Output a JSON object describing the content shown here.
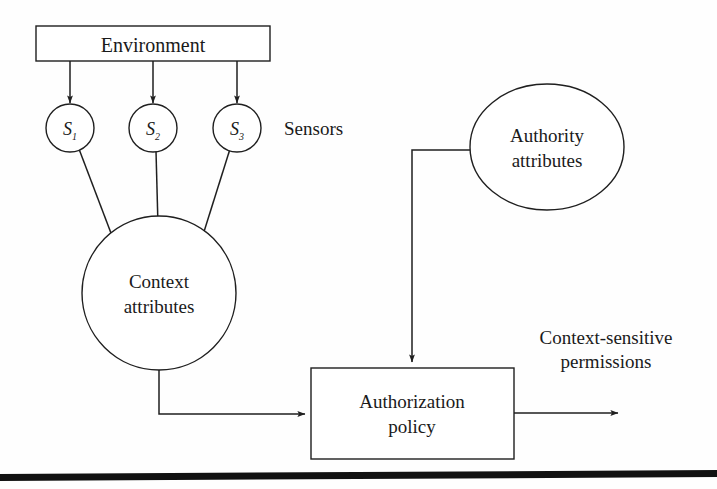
{
  "figure": {
    "background_color": "#fefefe",
    "stroke_color": "#1f1f1f",
    "text_color": "#1a1a1a"
  },
  "nodes": {
    "environment": {
      "label": "Environment",
      "shape": "rectangle"
    },
    "sensor_1": {
      "base": "S",
      "subscript": "1",
      "shape": "circle"
    },
    "sensor_2": {
      "base": "S",
      "subscript": "2",
      "shape": "circle"
    },
    "sensor_3": {
      "base": "S",
      "subscript": "3",
      "shape": "circle"
    },
    "context_attributes": {
      "line1": "Context",
      "line2": "attributes",
      "shape": "circle"
    },
    "authority_attributes": {
      "line1": "Authority",
      "line2": "attributes",
      "shape": "ellipse"
    },
    "authorization_policy": {
      "line1": "Authorization",
      "line2": "policy",
      "shape": "rectangle"
    }
  },
  "labels": {
    "sensors": "Sensors",
    "output_line1": "Context-sensitive",
    "output_line2": "permissions"
  },
  "edges": [
    {
      "name": "environment-to-sensor-1",
      "from": "environment",
      "to": "sensor_1",
      "arrow": true
    },
    {
      "name": "environment-to-sensor-2",
      "from": "environment",
      "to": "sensor_2",
      "arrow": true
    },
    {
      "name": "environment-to-sensor-3",
      "from": "environment",
      "to": "sensor_3",
      "arrow": true
    },
    {
      "name": "sensor-1-to-context",
      "from": "sensor_1",
      "to": "context_attributes",
      "arrow": true
    },
    {
      "name": "sensor-2-to-context",
      "from": "sensor_2",
      "to": "context_attributes",
      "arrow": true
    },
    {
      "name": "sensor-3-to-context",
      "from": "sensor_3",
      "to": "context_attributes",
      "arrow": true
    },
    {
      "name": "context-to-policy",
      "from": "context_attributes",
      "to": "authorization_policy",
      "arrow": true
    },
    {
      "name": "authority-to-policy",
      "from": "authority_attributes",
      "to": "authorization_policy",
      "arrow": true
    },
    {
      "name": "policy-to-permissions",
      "from": "authorization_policy",
      "to": "output",
      "arrow": true
    }
  ]
}
